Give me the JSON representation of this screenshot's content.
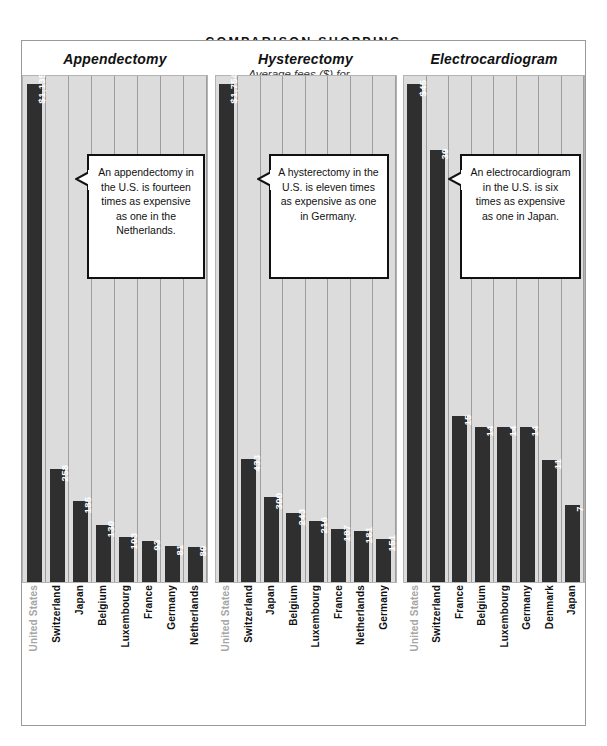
{
  "header": {
    "kicker": "COMPARISON SHOPPING",
    "subtitle": "Average fees ($) for..."
  },
  "colors": {
    "bar": "#2f2f2f",
    "plot_background": "#dcdcdc",
    "gridline": "#9d9d9d",
    "bar_label_text": "#ffffff",
    "muted_axis_label": "#a6a6a6",
    "frame_border": "#9a9a9a",
    "callout_border": "#111111"
  },
  "chart_data": [
    {
      "type": "bar",
      "title": "Appendectomy",
      "xlabel": "",
      "ylabel": "Average fees ($)",
      "ylim": [
        0,
        1135
      ],
      "grid": true,
      "categories": [
        "United States",
        "Switzerland",
        "Japan",
        "Belgium",
        "Luxembourg",
        "France",
        "Germany",
        "Netherlands"
      ],
      "values": [
        1135,
        258,
        185,
        130,
        103,
        93,
        81,
        80
      ],
      "value_labels": [
        "$1,135",
        "258",
        "185",
        "130",
        "103",
        "93",
        "81",
        "80"
      ],
      "highlight_category": "United States",
      "annotation": "An appendectomy in the U.S. is fourteen times as expensive as one in the Netherlands."
    },
    {
      "type": "bar",
      "title": "Hysterectomy",
      "xlabel": "",
      "ylabel": "Average fees ($)",
      "ylim": [
        0,
        1754
      ],
      "grid": true,
      "categories": [
        "United States",
        "Switzerland",
        "Japan",
        "Belgium",
        "Luxembourg",
        "France",
        "Netherlands",
        "Germany"
      ],
      "values": [
        1754,
        433,
        300,
        243,
        216,
        187,
        181,
        151
      ],
      "value_labels": [
        "$1,754",
        "433",
        "300",
        "243",
        "216",
        "187",
        "181",
        "151"
      ],
      "highlight_category": "United States",
      "annotation": "A hysterectomy in the U.S. is eleven times as expensive as one in Germany."
    },
    {
      "type": "bar",
      "title": "Electrocardiogram",
      "xlabel": "",
      "ylabel": "Average fees ($)",
      "ylim": [
        0,
        45
      ],
      "grid": true,
      "categories": [
        "United States",
        "Switzerland",
        "France",
        "Belgium",
        "Luxembourg",
        "Germany",
        "Denmark",
        "Japan"
      ],
      "values": [
        45,
        39,
        15,
        14,
        14,
        14,
        11,
        7
      ],
      "value_labels": [
        "$45",
        "39",
        "15",
        "14",
        "14",
        "14",
        "11",
        "7"
      ],
      "highlight_category": "United States",
      "annotation": "An electrocardiogram in the U.S. is six times as expensive as one in Japan."
    }
  ]
}
